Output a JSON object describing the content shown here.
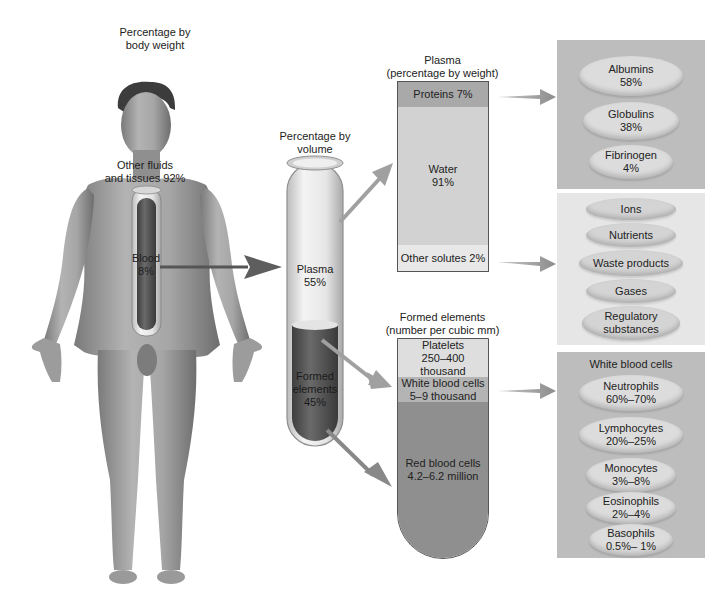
{
  "body_section": {
    "title_line1": "Percentage by",
    "title_line2": "body weight",
    "other_line1": "Other fluids",
    "other_line2": "and tissues 92%",
    "blood_line1": "Blood",
    "blood_line2": "8%"
  },
  "volume_tube": {
    "title_line1": "Percentage by",
    "title_line2": "volume",
    "plasma_line1": "Plasma",
    "plasma_line2": "55%",
    "formed_line1": "Formed",
    "formed_line2": "elements",
    "formed_line3": "45%"
  },
  "plasma_box": {
    "title_line1": "Plasma",
    "title_line2": "(percentage by weight)",
    "proteins": "Proteins 7%",
    "water_line1": "Water",
    "water_line2": "91%",
    "other_solutes": "Other solutes 2%"
  },
  "formed_box": {
    "title_line1": "Formed elements",
    "title_line2": "(number per cubic mm)",
    "platelets_line1": "Platelets",
    "platelets_line2": "250–400 thousand",
    "wbc_line1": "White blood cells",
    "wbc_line2": "5–9 thousand",
    "rbc_line1": "Red blood cells",
    "rbc_line2": "4.2–6.2 million"
  },
  "proteins_panel": {
    "items": [
      {
        "name": "Albumins",
        "value": "58%"
      },
      {
        "name": "Globulins",
        "value": "38%"
      },
      {
        "name": "Fibrinogen",
        "value": "4%"
      }
    ]
  },
  "solutes_panel": {
    "items": [
      {
        "line1": "Ions",
        "line2": ""
      },
      {
        "line1": "Nutrients",
        "line2": ""
      },
      {
        "line1": "Waste products",
        "line2": ""
      },
      {
        "line1": "Gases",
        "line2": ""
      },
      {
        "line1": "Regulatory",
        "line2": "substances"
      }
    ]
  },
  "wbc_panel": {
    "title": "White blood cells",
    "items": [
      {
        "name": "Neutrophils",
        "value": "60%–70%"
      },
      {
        "name": "Lymphocytes",
        "value": "20%–25%"
      },
      {
        "name": "Monocytes",
        "value": "3%–8%"
      },
      {
        "name": "Eosinophils",
        "value": "2%–4%"
      },
      {
        "name": "Basophils",
        "value": "0.5%– 1%"
      }
    ]
  },
  "colors": {
    "panel_dark": "#bdbdbd",
    "panel_light": "#e6e6e6",
    "oval": "#dcdcdc",
    "proteins_seg": "#a9a9a9",
    "water_seg": "#d2d2d2",
    "solutes_seg": "#e8e8e8",
    "platelets_seg": "#dedede",
    "wbc_seg": "#b4b4b4",
    "rbc_seg": "#8f8f8f",
    "arrow": "#9a9a9a",
    "blood": "#5a5a5a",
    "skin": "#a0a0a0"
  }
}
